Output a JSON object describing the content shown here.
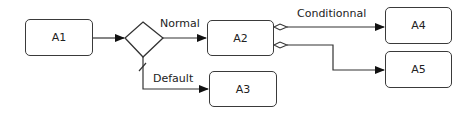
{
  "diagram": {
    "nodes": [
      {
        "id": "A1",
        "label": "A1"
      },
      {
        "id": "A2",
        "label": "A2"
      },
      {
        "id": "A3",
        "label": "A3"
      },
      {
        "id": "A4",
        "label": "A4"
      },
      {
        "id": "A5",
        "label": "A5"
      }
    ],
    "gateway": {
      "type": "exclusive-gateway"
    },
    "edges": [
      {
        "from": "A1",
        "to": "gateway",
        "label": ""
      },
      {
        "from": "gateway",
        "to": "A2",
        "label": "Normal"
      },
      {
        "from": "gateway",
        "to": "A3",
        "label": "Default",
        "type": "default-flow"
      },
      {
        "from": "A2",
        "to": "A4",
        "label": "Conditionnal",
        "type": "conditional-flow"
      },
      {
        "from": "A2",
        "to": "A5",
        "label": "",
        "type": "conditional-flow"
      }
    ]
  }
}
